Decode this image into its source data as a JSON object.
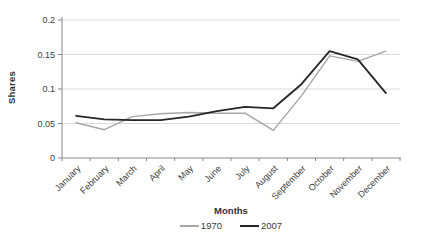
{
  "chart_data": {
    "type": "line",
    "title": "",
    "xlabel": "Months",
    "ylabel": "Shares",
    "categories": [
      "January",
      "February",
      "March",
      "April",
      "May",
      "June",
      "July",
      "August",
      "September",
      "October",
      "November",
      "December"
    ],
    "series": [
      {
        "name": "1970",
        "color": "#a6a6a6",
        "values": [
          0.051,
          0.041,
          0.06,
          0.064,
          0.066,
          0.065,
          0.065,
          0.04,
          0.09,
          0.148,
          0.14,
          0.155
        ]
      },
      {
        "name": "2007",
        "color": "#262626",
        "values": [
          0.061,
          0.056,
          0.055,
          0.055,
          0.06,
          0.068,
          0.074,
          0.072,
          0.107,
          0.155,
          0.143,
          0.094
        ]
      }
    ],
    "ylim": [
      0,
      0.2
    ],
    "yticks": [
      0,
      0.05,
      0.1,
      0.15,
      0.2
    ],
    "ytick_labels": [
      "0",
      "0.05",
      "0.1",
      "0.15",
      "0.2"
    ],
    "grid": "horizontal",
    "legend_position": "bottom-center"
  },
  "colors": {
    "background": "#ffffff",
    "gridline": "#d9d9d9",
    "axis": "#898989",
    "tick_text": "#3b3b3b"
  }
}
